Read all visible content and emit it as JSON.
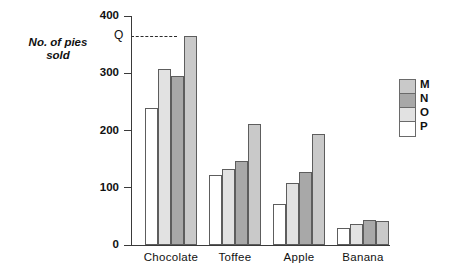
{
  "chart_data": {
    "type": "bar",
    "title": "",
    "subtitle": "",
    "xlabel": "",
    "ylabel": "No. of pies\nsold",
    "categories": [
      "Chocolate",
      "Toffee",
      "Apple",
      "Banana"
    ],
    "series": [
      {
        "name": "P",
        "color": "#ffffff",
        "values": [
          240,
          123,
          72,
          30
        ]
      },
      {
        "name": "O",
        "color": "#e2e2e2",
        "values": [
          307,
          133,
          108,
          37
        ]
      },
      {
        "name": "N",
        "color": "#a8a8a8",
        "values": [
          295,
          147,
          128,
          44
        ]
      },
      {
        "name": "M",
        "color": "#c9c9c9",
        "values": [
          365,
          212,
          194,
          42
        ]
      }
    ],
    "legend_order": [
      "M",
      "N",
      "O",
      "P"
    ],
    "legend_position": "right",
    "ylim": [
      0,
      400
    ],
    "yticks": [
      0,
      100,
      200,
      300,
      400
    ],
    "ytick_labels": [
      "0",
      "100",
      "200",
      "300",
      "400"
    ],
    "grid": false,
    "annotations": [
      {
        "label": "Q",
        "type": "dashed-reference-line",
        "value": 365
      }
    ]
  },
  "legend": {
    "items": [
      {
        "label": "M",
        "color": "#c9c9c9"
      },
      {
        "label": "N",
        "color": "#a8a8a8"
      },
      {
        "label": "O",
        "color": "#e2e2e2"
      },
      {
        "label": "P",
        "color": "#ffffff"
      }
    ]
  },
  "colors": {
    "axis": "#3a3a3a",
    "bar_outline": "#5d5d5d",
    "text": "#111111",
    "background": "#ffffff"
  }
}
